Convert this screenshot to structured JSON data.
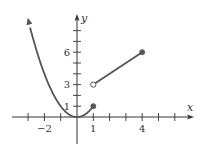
{
  "chart_data": {
    "type": "line",
    "title": "",
    "xlabel": "x",
    "ylabel": "y",
    "x_tick_labels": [
      {
        "value": -2,
        "label": "−2"
      },
      {
        "value": 1,
        "label": "1"
      },
      {
        "value": 4,
        "label": "4"
      }
    ],
    "y_tick_labels": [
      {
        "value": 1,
        "label": "1"
      },
      {
        "value": 3,
        "label": "3"
      },
      {
        "value": 6,
        "label": "6"
      }
    ],
    "x_ticks": [
      -3,
      -2,
      -1,
      1,
      2,
      3,
      4,
      5,
      6
    ],
    "y_ticks": [
      1,
      2,
      3,
      4,
      5,
      6,
      7,
      8
    ],
    "xlim": [
      -4,
      7
    ],
    "ylim": [
      -2.5,
      9.5
    ],
    "grid": false,
    "series": [
      {
        "name": "piece-1",
        "formula": "y = x^2",
        "domain": [
          -3,
          1
        ],
        "left_end": "arrow",
        "right_end": "closed",
        "points": [
          [
            -3,
            9
          ],
          [
            -2,
            4
          ],
          [
            -1,
            1
          ],
          [
            0,
            0
          ],
          [
            1,
            1
          ]
        ]
      },
      {
        "name": "piece-2",
        "formula": "y = x + 2",
        "domain": [
          1,
          4
        ],
        "left_end": "open",
        "right_end": "closed",
        "points": [
          [
            1,
            3
          ],
          [
            4,
            6
          ]
        ]
      }
    ],
    "endpoints": [
      {
        "x": 1,
        "y": 1,
        "style": "closed"
      },
      {
        "x": 1,
        "y": 3,
        "style": "open"
      },
      {
        "x": 4,
        "y": 6,
        "style": "closed"
      }
    ]
  },
  "colors": {
    "axis": "#333333",
    "curve": "#555555",
    "background": "#ffffff"
  }
}
